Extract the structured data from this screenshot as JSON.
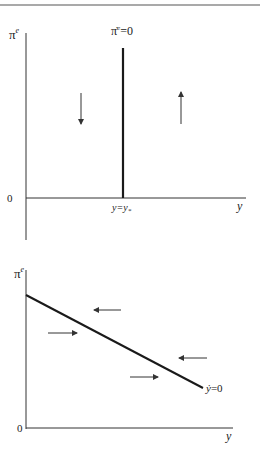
{
  "page": {
    "header_rule": true
  },
  "top_diagram": {
    "y_axis_label": "π",
    "y_axis_label_sup": "e",
    "x_axis_label": "y",
    "origin_label": "0",
    "vertical_locus_label_main": "π̇",
    "vertical_locus_label_sup": "e",
    "vertical_locus_label_rest": "=0",
    "x_marker_label_a": "y=y",
    "x_marker_label_sub": "*",
    "arrows": [
      {
        "direction": "down",
        "region": "left of locus"
      },
      {
        "direction": "up",
        "region": "right of locus"
      }
    ]
  },
  "bottom_diagram": {
    "y_axis_label": "π",
    "y_axis_label_sup": "e",
    "x_axis_label": "y",
    "origin_label": "0",
    "locus_label_main": "ẏ",
    "locus_label_rest": "=0",
    "arrows": [
      {
        "direction": "left",
        "region": "above locus"
      },
      {
        "direction": "right",
        "region": "below locus"
      },
      {
        "direction": "left",
        "region": "above locus"
      },
      {
        "direction": "right",
        "region": "below locus"
      }
    ]
  },
  "colors": {
    "line": "#1a1a1a",
    "axis": "#333333",
    "arrow": "#333333",
    "text": "#222222",
    "rule": "#555555"
  }
}
